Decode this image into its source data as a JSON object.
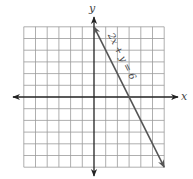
{
  "chart_data": {
    "type": "line",
    "title": "",
    "xlabel": "x",
    "ylabel": "y",
    "xlim": [
      -6,
      6
    ],
    "ylim": [
      -6,
      6
    ],
    "grid": true,
    "grid_step": 1,
    "tick_labels": false,
    "series": [
      {
        "name": "2x + y = 6",
        "equation": "2x + y = 6",
        "points": [
          [
            0,
            6
          ],
          [
            3,
            0
          ],
          [
            6,
            -6
          ]
        ],
        "arrows_both_ends": true,
        "label_rotated_along_line": true
      }
    ]
  },
  "axes": {
    "x_label": "x",
    "y_label": "y"
  },
  "line_label": "2x + y = 6",
  "colors": {
    "grid": "#9a9a9a",
    "axis": "#222222",
    "line": "#555555",
    "label": "#444444"
  }
}
